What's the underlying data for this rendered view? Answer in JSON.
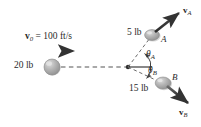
{
  "figure": {
    "background_color": "#ffffff",
    "line_color": "#3a3a3a",
    "sphere_color": "#a8a8a8"
  },
  "labels": {
    "initial_velocity": "v",
    "initial_velocity_sub": "0",
    "initial_velocity_rest": " = 100 ft/s",
    "incoming_weight": "20 lb",
    "sphere_a_weight": "5 lb",
    "sphere_b_weight": "15 lb",
    "sphere_a_name": "A",
    "sphere_b_name": "B",
    "velocity_a": "v",
    "velocity_a_sub": "A",
    "velocity_b": "v",
    "velocity_b_sub": "B",
    "angle_a": "θ",
    "angle_a_sub": "A",
    "angle_b": "θ",
    "angle_b_sub": "B"
  },
  "values": {
    "initial_velocity_magnitude": 100,
    "initial_velocity_units": "ft/s",
    "incoming_weight_lb": 20,
    "sphere_a_weight_lb": 5,
    "sphere_b_weight_lb": 15
  },
  "geometry": {
    "impact_point": [
      128,
      67
    ],
    "incoming_sphere_center": [
      52,
      67
    ],
    "sphere_a_center": [
      152,
      35
    ],
    "sphere_b_center": [
      163,
      83
    ],
    "v0_arrow": [
      28,
      51,
      78,
      51
    ],
    "va_arrow_tip": [
      182,
      11
    ],
    "vb_arrow_tip": [
      192,
      106
    ]
  }
}
